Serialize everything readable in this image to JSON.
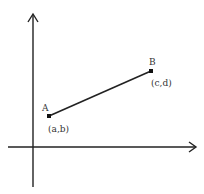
{
  "diagram": {
    "type": "coordinate-plane-line-segment",
    "axes": {
      "x_axis": {
        "arrow": true
      },
      "y_axis": {
        "arrow": true
      }
    },
    "points": [
      {
        "name": "A",
        "coord_label": "(a,b)"
      },
      {
        "name": "B",
        "coord_label": "(c,d)"
      }
    ],
    "segment": {
      "from": "A",
      "to": "B"
    },
    "colors": {
      "stroke": "#222222",
      "text": "#333333",
      "background": "#ffffff"
    }
  }
}
